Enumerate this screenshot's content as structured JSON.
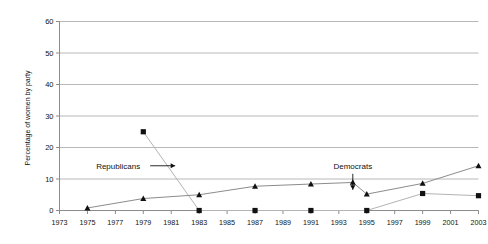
{
  "chart_data": {
    "type": "line",
    "title": "",
    "subtitle": "",
    "xlabel": "",
    "ylabel": "Percentage of women by party",
    "xlim": [
      1973,
      2003
    ],
    "ylim": [
      0,
      60
    ],
    "ytick_labels": [
      "0",
      "10",
      "20",
      "30",
      "40",
      "50",
      "60"
    ],
    "ytick_values": [
      0,
      10,
      20,
      30,
      40,
      50,
      60
    ],
    "xtick_labels": [
      "1973",
      "1975",
      "1977",
      "1979",
      "1981",
      "1983",
      "1985",
      "1987",
      "1989",
      "1991",
      "1993",
      "1995",
      "1997",
      "1999",
      "2001",
      "2003"
    ],
    "xtick_values": [
      1973,
      1975,
      1977,
      1979,
      1981,
      1983,
      1985,
      1987,
      1989,
      1991,
      1993,
      1995,
      1997,
      1999,
      2001,
      2003
    ],
    "grid": "horizontal",
    "legend": "none",
    "series": [
      {
        "name": "Republicans",
        "marker": "square",
        "color": "#111111",
        "line_color": "#b3b3b3",
        "x": [
          1979,
          1983,
          1987,
          1991,
          1995,
          1999,
          2003
        ],
        "values": [
          25,
          0,
          0,
          0,
          0,
          5.4,
          4.7
        ]
      },
      {
        "name": "Democrats",
        "marker": "triangle",
        "color": "#111111",
        "line_color": "#8c8c8c",
        "x": [
          1975,
          1979,
          1983,
          1987,
          1991,
          1994,
          1995,
          1999,
          2003
        ],
        "values": [
          0.8,
          3.8,
          5.0,
          7.7,
          8.4,
          8.9,
          5.2,
          8.6,
          14.2
        ]
      }
    ],
    "annotations": [
      {
        "id": "republicans-annotation",
        "label": "Republicans",
        "arrow": "right",
        "x": 1977.2,
        "y": 14.2
      },
      {
        "id": "democrats-annotation",
        "label": "Democrats",
        "arrow": "down",
        "x": 1994,
        "y": 14.2
      }
    ]
  },
  "axis": {
    "y_title": "Percentage of women by party"
  }
}
